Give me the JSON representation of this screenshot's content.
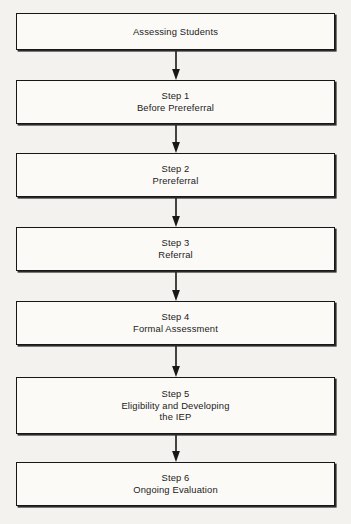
{
  "diagram": {
    "type": "flowchart",
    "orientation": "vertical",
    "title": "Assessing Students",
    "colors": {
      "background": "#f4f2ee",
      "box_fill": "#fbfaf7",
      "stroke": "#171717",
      "text": "#1b1b1b"
    },
    "nodes": [
      {
        "id": "assessing-students",
        "lines": [
          "Assessing Students"
        ],
        "top": 13,
        "height": 37
      },
      {
        "id": "step-1",
        "lines": [
          "Step 1",
          "Before Prereferral"
        ],
        "top": 80,
        "height": 44
      },
      {
        "id": "step-2",
        "lines": [
          "Step 2",
          "Prereferral"
        ],
        "top": 153,
        "height": 44
      },
      {
        "id": "step-3",
        "lines": [
          "Step 3",
          "Referral"
        ],
        "top": 227,
        "height": 44
      },
      {
        "id": "step-4",
        "lines": [
          "Step 4",
          "Formal Assessment"
        ],
        "top": 301,
        "height": 44
      },
      {
        "id": "step-5",
        "lines": [
          "Step 5",
          "Eligibility and Developing",
          "the IEP"
        ],
        "top": 377,
        "height": 57
      },
      {
        "id": "step-6",
        "lines": [
          "Step 6",
          "Ongoing Evaluation"
        ],
        "top": 462,
        "height": 44
      }
    ],
    "connectors": [
      {
        "id": "arrow-1",
        "from": "assessing-students",
        "to": "step-1",
        "top": 50,
        "height": 30
      },
      {
        "id": "arrow-2",
        "from": "step-1",
        "to": "step-2",
        "top": 124,
        "height": 29
      },
      {
        "id": "arrow-3",
        "from": "step-2",
        "to": "step-3",
        "top": 197,
        "height": 30
      },
      {
        "id": "arrow-4",
        "from": "step-3",
        "to": "step-4",
        "top": 271,
        "height": 30
      },
      {
        "id": "arrow-5",
        "from": "step-4",
        "to": "step-5",
        "top": 345,
        "height": 32
      },
      {
        "id": "arrow-6",
        "from": "step-5",
        "to": "step-6",
        "top": 434,
        "height": 28
      }
    ]
  }
}
